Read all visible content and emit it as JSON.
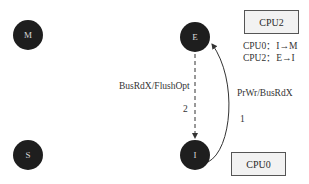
{
  "states": {
    "M": "M",
    "E": "E",
    "S": "S",
    "I": "I"
  },
  "boxes": {
    "cpu2": "CPU2",
    "cpu0": "CPU0"
  },
  "notes": {
    "line1": "CPU0：I→M",
    "line2": "CPU2：E→I"
  },
  "transitions": {
    "e_to_i": {
      "label": "BusRdX/FlushOpt",
      "step": "2",
      "style": "dashed"
    },
    "i_to_e": {
      "label": "PrWr/BusRdX",
      "step": "1",
      "style": "solid"
    }
  },
  "colors": {
    "node_fill": "#1e1e1e",
    "node_text": "#d8d8d8",
    "box_fill": "#f2f2f2",
    "line": "#333333"
  }
}
